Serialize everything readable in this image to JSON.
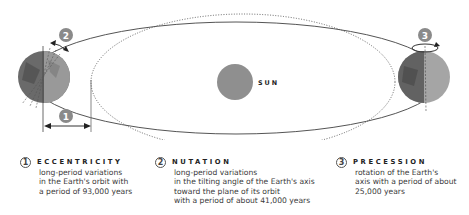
{
  "diagram": {
    "sun_label": "SUN",
    "markers": [
      {
        "number": "1",
        "meaning": "eccentricity"
      },
      {
        "number": "2",
        "meaning": "nutation"
      },
      {
        "number": "3",
        "meaning": "precession"
      }
    ],
    "colors": {
      "sun": "#8f8f8f",
      "orbit_solid": "#555555",
      "orbit_dotted": "#555555",
      "marker_fill": "#8a8a8a",
      "earth_dark": "#555555",
      "earth_light": "#9a9a9a"
    }
  },
  "captions": [
    {
      "number": "1",
      "title": "ECCENTRICITY",
      "lines": [
        "long-period variations",
        "in the Earth's orbit with",
        "a period of 93,000 years"
      ]
    },
    {
      "number": "2",
      "title": "NUTATION",
      "lines": [
        "long-period variations",
        "in the tilting angle of the Earth's axis",
        "toward the plane of its orbit",
        "with a period of about 41,000 years"
      ]
    },
    {
      "number": "3",
      "title": "PRECESSION",
      "lines": [
        "rotation of the Earth's",
        "axis with a period of about",
        "25,000 years"
      ]
    }
  ]
}
